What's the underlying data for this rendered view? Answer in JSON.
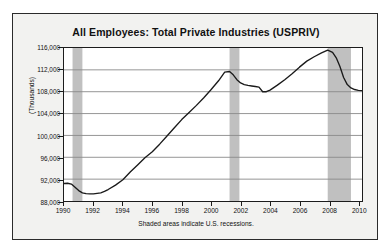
{
  "chart_data": {
    "type": "line",
    "title": "All Employees:  Total Private Industries (USPRIV)",
    "xlabel": "",
    "ylabel": "(Thousands)",
    "footnote": "Shaded areas indicate U.S. recessions.",
    "xlim": [
      1990,
      2010.25
    ],
    "ylim": [
      88000,
      116000
    ],
    "ytick_labels": [
      "116,000",
      "112,000",
      "108,000",
      "104,000",
      "100,000",
      "96,000",
      "92,000",
      "88,000"
    ],
    "ytick_values": [
      116000,
      112000,
      108000,
      104000,
      100000,
      96000,
      92000,
      88000
    ],
    "xtick_labels": [
      "1990",
      "1992",
      "1994",
      "1996",
      "1998",
      "2000",
      "2002",
      "2004",
      "2006",
      "2008",
      "2010"
    ],
    "xtick_values": [
      1990,
      1992,
      1994,
      1996,
      1998,
      2000,
      2002,
      2004,
      2006,
      2008,
      2010
    ],
    "grid": "horizontal",
    "legend": "none",
    "line_color": "#1a1a1a",
    "recession_band_color": "#c0c0c0",
    "plot_background": "#ffffff",
    "figure_background": "#f2f2f0",
    "recessions": [
      {
        "start": 1990.58,
        "end": 1991.25
      },
      {
        "start": 2001.25,
        "end": 2001.92
      },
      {
        "start": 2007.92,
        "end": 2009.5
      }
    ],
    "series": [
      {
        "name": "All Employees: Total Private Industries (USPRIV)",
        "x": [
          1990.0,
          1990.25,
          1990.5,
          1990.75,
          1991.0,
          1991.25,
          1991.5,
          1991.75,
          1992.0,
          1992.25,
          1992.5,
          1992.75,
          1993.0,
          1993.5,
          1994.0,
          1994.5,
          1995.0,
          1995.5,
          1996.0,
          1996.5,
          1997.0,
          1997.5,
          1998.0,
          1998.5,
          1999.0,
          1999.5,
          2000.0,
          2000.5,
          2000.92,
          2001.25,
          2001.5,
          2001.75,
          2002.0,
          2002.25,
          2002.5,
          2002.75,
          2003.0,
          2003.25,
          2003.5,
          2003.75,
          2004.0,
          2004.5,
          2005.0,
          2005.5,
          2006.0,
          2006.5,
          2007.0,
          2007.5,
          2007.92,
          2008.25,
          2008.5,
          2008.75,
          2009.0,
          2009.25,
          2009.5,
          2009.75,
          2010.0,
          2010.25
        ],
        "y": [
          91200,
          91250,
          91100,
          90500,
          89900,
          89500,
          89350,
          89300,
          89300,
          89400,
          89500,
          89750,
          90100,
          90900,
          91900,
          93300,
          94600,
          95900,
          97000,
          98400,
          99900,
          101400,
          102900,
          104200,
          105500,
          106900,
          108400,
          110000,
          111600,
          111700,
          111100,
          110200,
          109600,
          109300,
          109150,
          109050,
          108950,
          108850,
          108000,
          108000,
          108300,
          109200,
          110200,
          111300,
          112500,
          113600,
          114400,
          115100,
          115600,
          115200,
          114200,
          112600,
          110600,
          109300,
          108700,
          108400,
          108250,
          108200
        ]
      }
    ]
  }
}
